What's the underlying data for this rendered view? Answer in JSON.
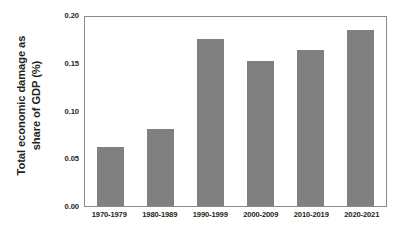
{
  "chart_data": {
    "type": "bar",
    "title": "",
    "subtitle": "",
    "xlabel": "",
    "ylabel": "Total economic damage as share of GDP (%)",
    "ylabel_lines": [
      "Total economic damage as",
      "share of GDP (%)"
    ],
    "categories": [
      "1970-1979",
      "1980-1989",
      "1990-1999",
      "2000-2009",
      "2010-2019",
      "2020-2021"
    ],
    "values": [
      0.062,
      0.082,
      0.177,
      0.153,
      0.165,
      0.186
    ],
    "ylim": [
      0.0,
      0.2
    ],
    "ytick_labels": [
      "0.00",
      "0.05",
      "0.10",
      "0.15",
      "0.20"
    ],
    "ytick_values": [
      0.0,
      0.05,
      0.1,
      0.15,
      0.2
    ],
    "grid": false,
    "legend": null,
    "legend_position": "none",
    "bar_color": "#808080",
    "frame_color": "#8b8b8b",
    "background_color": "#ffffff",
    "text_color": "#231f20"
  }
}
